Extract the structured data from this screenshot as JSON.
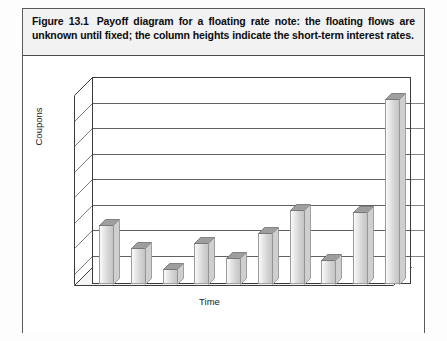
{
  "figure": {
    "number": "Figure 13.1",
    "caption": "Payoff diagram for a floating rate note: the floating flows are unknown until fixed; the column heights indicate the short-term interest rates."
  },
  "chart_data": {
    "type": "bar",
    "title": "",
    "subtitle": "",
    "xlabel": "Time",
    "ylabel": "Coupons",
    "categories": [
      "1",
      "2",
      "3",
      "4",
      "5",
      "6",
      "7",
      "8",
      "9",
      "10"
    ],
    "values": [
      2.3,
      1.4,
      0.6,
      1.6,
      1.0,
      2.0,
      2.9,
      0.95,
      2.8,
      7.2
    ],
    "ylim": [
      0,
      8
    ],
    "yticks": [
      0,
      1,
      2,
      3,
      4,
      5,
      6,
      7,
      8
    ],
    "tick_labels_visible": false,
    "grid": true,
    "grid_axis": "y",
    "legend": "none",
    "style": "3d-column",
    "bar_color": "#dcdcdc",
    "bar_edge_color": "#9b9b9b",
    "axis_color": "#3b3b3b",
    "gridline_color": "#000000",
    "note": "Unlabeled axes; column heights represent short-term interest rates over time, final column is the largest (principal plus coupon)."
  },
  "axes": {
    "y_title": "Coupons",
    "x_title": "Time"
  },
  "colors": {
    "caption_background": "#f2f2f2",
    "frame_border": "#5a5a5a",
    "page_background": "#ffffff",
    "text": "#0b0b0b"
  }
}
